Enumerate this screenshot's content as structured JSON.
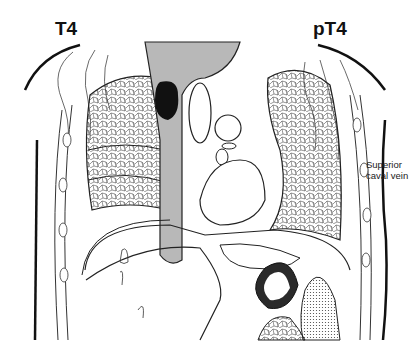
{
  "diagram": {
    "type": "anatomical coronal section of the thorax",
    "labels": {
      "left_stage": "T4",
      "right_stage": "pT4",
      "annotation_line1": "Superior",
      "annotation_line2": "caval vein"
    },
    "colors": {
      "line": "#1a1a1a",
      "trachea_fill": "#b8b8b8",
      "tumor": "#111111",
      "background": "#ffffff"
    }
  }
}
